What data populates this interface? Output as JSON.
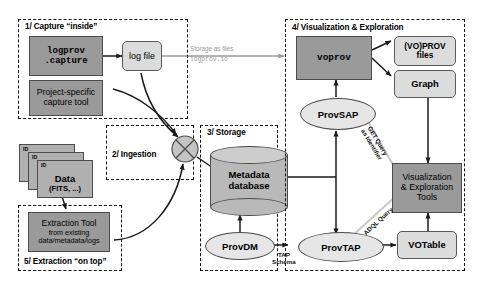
{
  "diagram": {
    "groups": [
      {
        "id": "capture",
        "label": "1/ Capture “inside”"
      },
      {
        "id": "ingestion",
        "label": "2/ Ingestion"
      },
      {
        "id": "storage",
        "label": "3/ Storage"
      },
      {
        "id": "viz",
        "label": "4/ Visualization & Exploration"
      },
      {
        "id": "extraction",
        "label": "5/ Extraction “on top”"
      }
    ],
    "nodes": {
      "logprov_capture": {
        "line1": "logprov",
        "line2": ".capture",
        "shape": "rect",
        "fill": "dark"
      },
      "project_tool": {
        "line1": "Project-specific",
        "line2": "capture tool",
        "shape": "rect",
        "fill": "dark"
      },
      "log_file": {
        "label": "log file",
        "shape": "rounded",
        "fill": "light"
      },
      "data_stack": {
        "line1": "Data",
        "line2": "(FITS, ...)",
        "id_label": "ID",
        "shape": "card-stack",
        "fill": "dark"
      },
      "extraction_tool": {
        "line1": "Extraction Tool",
        "line2": "from existing",
        "line3": "data/metadata/logs",
        "shape": "rect",
        "fill": "dark"
      },
      "merge_node": {
        "label": "",
        "shape": "circle-cross",
        "fill": "light"
      },
      "metadata_db": {
        "line1": "Metadata",
        "line2": "database",
        "shape": "cylinder",
        "fill": "light"
      },
      "provdm": {
        "label": "ProvDM",
        "shape": "ellipse",
        "fill": "light"
      },
      "provtap": {
        "label": "ProvTAP",
        "shape": "ellipse",
        "fill": "light"
      },
      "provsap": {
        "label": "ProvSAP",
        "shape": "ellipse",
        "fill": "light"
      },
      "voprov": {
        "label": "voprov",
        "shape": "rect",
        "fill": "dark"
      },
      "voprov_files": {
        "line1": "(VO)PROV",
        "line2": "files",
        "shape": "rounded",
        "fill": "light"
      },
      "graph": {
        "label": "Graph",
        "shape": "rounded",
        "fill": "light"
      },
      "votable": {
        "label": "VOTable",
        "shape": "rounded",
        "fill": "light"
      },
      "viz_tools": {
        "line1": "Visualization",
        "line2": "& Exploration",
        "line3": "Tools",
        "shape": "rect",
        "fill": "dark"
      }
    },
    "notes": {
      "storage_as_files": "Storage as files",
      "logprov_io": "logprov.io"
    },
    "edge_labels": {
      "tap_schema_line1": "TAP",
      "tap_schema_line2": "Schema",
      "get_query": "GET Query",
      "as_identifier": "as Identifier",
      "adql_query": "ADQL Query"
    },
    "colors": {
      "dark_fill": "#9a9a9a",
      "light_fill": "#dcdcdc",
      "stroke": "#4c4c4c",
      "note_gray": "#9a9a9a",
      "background": "#ffffff"
    }
  }
}
